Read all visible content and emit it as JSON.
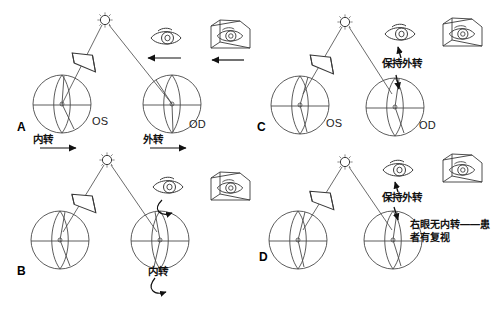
{
  "figure": {
    "background_color": "#ffffff",
    "line_color": "#3a3a3a",
    "text_color": "#111111"
  },
  "panels": [
    {
      "letter": "A",
      "left_eye_label": "OS",
      "right_eye_label": "OD",
      "left_motion_label": "内转",
      "right_motion_label": "外转",
      "left_arrow": "right-arrow",
      "right_arrow": "right-arrow",
      "eye_icon": "eye-icon",
      "box_icon": "boxed-eye-icon",
      "eye_arrow": "left-arrow",
      "box_arrow": "left-arrow",
      "prism": "prism-wedge",
      "light": "fixation-light"
    },
    {
      "letter": "B",
      "left_eye_label": "",
      "right_eye_label": "",
      "left_motion_label": "",
      "right_motion_label": "内转",
      "right_arrow": "curved-arrow",
      "eye_icon": "eye-icon",
      "box_icon": "boxed-eye-icon",
      "eye_arrow": "curved-arrow",
      "prism": "prism-wedge",
      "light": "fixation-light"
    },
    {
      "letter": "C",
      "left_eye_label": "OS",
      "right_eye_label": "OD",
      "note_label": "保持外转",
      "eye_icon": "eye-icon",
      "box_icon": "boxed-eye-icon",
      "pointer_up": "up-arrow",
      "pointer_down": "down-arrow",
      "prism": "prism-wedge",
      "light": "fixation-light"
    },
    {
      "letter": "D",
      "left_eye_label": "",
      "right_eye_label": "",
      "note_label": "保持外转",
      "diagnosis_label": "右眼无内转——患者有复视",
      "eye_icon": "eye-icon",
      "box_icon": "boxed-eye-icon",
      "pointer_up": "up-arrow",
      "pointer_down": "down-arrow",
      "prism": "prism-wedge",
      "light": "fixation-light"
    }
  ]
}
